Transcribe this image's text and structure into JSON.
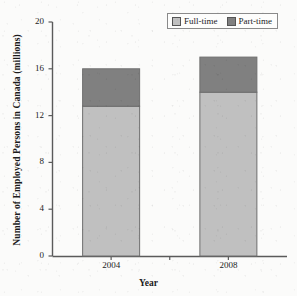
{
  "chart_data": {
    "type": "bar",
    "subtype": "stacked-bar",
    "title": "",
    "xlabel": "Year",
    "ylabel": "Number of Employed Persons in Canada (millions)",
    "categories": [
      "2004",
      "2008"
    ],
    "series": [
      {
        "name": "Full-time",
        "values": [
          12.8,
          14.0
        ],
        "color": "#c0c0c0"
      },
      {
        "name": "Part-time",
        "values": [
          3.2,
          3.0
        ],
        "color": "#808080"
      }
    ],
    "totals": [
      16.0,
      17.0
    ],
    "ylim": [
      0,
      20
    ],
    "yticks": [
      "0",
      "4",
      "8",
      "12",
      "16",
      "20"
    ],
    "ytick_values": [
      0,
      4,
      8,
      12,
      16,
      20
    ],
    "grid": false,
    "legend_position": "top-right",
    "legend_entries": [
      "Full-time",
      "Part-time"
    ]
  },
  "axes": {
    "y_title": "Number of Employed Persons in Canada (millions)",
    "x_title": "Year"
  },
  "legend": {
    "items": [
      {
        "label": "Full-time",
        "color": "#c0c0c0"
      },
      {
        "label": "Part-time",
        "color": "#808080"
      }
    ]
  },
  "colors": {
    "full_time": "#c0c0c0",
    "part_time": "#808080",
    "axis": "#5a5a5a",
    "bar_border": "#6e6e6e",
    "background": "#fbfbfa"
  }
}
